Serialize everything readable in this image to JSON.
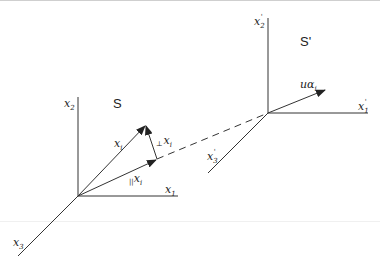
{
  "diagram": {
    "frame_S": {
      "name": "S",
      "axes": {
        "x1": "x",
        "x1_sub": "1",
        "x2": "x",
        "x2_sub": "2",
        "x3": "x",
        "x3_sub": "3"
      },
      "vectors": {
        "x_i": {
          "main": "x",
          "sub": "i"
        },
        "parallel": {
          "prefix": "||",
          "main": "x",
          "sub": "i"
        },
        "perpendicular": {
          "prefix": "⊥",
          "main": "x",
          "sub": "i"
        }
      }
    },
    "frame_S_prime": {
      "name": "S'",
      "axes": {
        "x1": "x",
        "x1_sub": "1",
        "x2": "x",
        "x2_sub": "2",
        "x3": "x",
        "x3_sub": "3",
        "prime": "'"
      },
      "velocity": {
        "u": "u",
        "alpha": "α",
        "sub": "i"
      }
    },
    "colors": {
      "stroke": "#333333",
      "text": "#222222",
      "background": "#ffffff"
    }
  }
}
